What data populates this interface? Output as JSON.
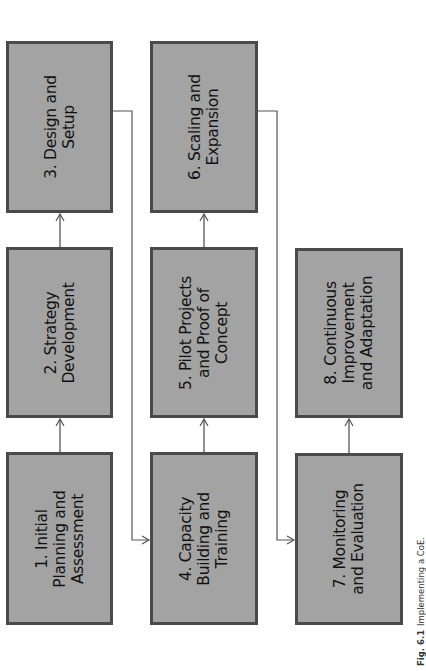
{
  "diagram": {
    "type": "process-flow",
    "orientation": "rotated -90deg",
    "colors": {
      "box_fill": "#a3a3a3",
      "box_border": "#4a4a4a",
      "connector": "#555555",
      "text": "#111111"
    },
    "steps": [
      {
        "id": 1,
        "label": "1. Initial\nPlanning and\nAssessment"
      },
      {
        "id": 2,
        "label": "2. Strategy\nDevelopment"
      },
      {
        "id": 3,
        "label": "3. Design and\nSetup"
      },
      {
        "id": 4,
        "label": "4. Capacity\nBuilding and\nTraining"
      },
      {
        "id": 5,
        "label": "5. Pilot Projects\nand Proof of\nConcept"
      },
      {
        "id": 6,
        "label": "6. Scaling and\nExpansion"
      },
      {
        "id": 7,
        "label": "7. Monitoring\nand Evaluation"
      },
      {
        "id": 8,
        "label": "8. Continuous\nImprovement\nand Adaptation"
      }
    ],
    "edges": [
      {
        "from": 1,
        "to": 2
      },
      {
        "from": 2,
        "to": 3
      },
      {
        "from": 3,
        "to": 4
      },
      {
        "from": 4,
        "to": 5
      },
      {
        "from": 5,
        "to": 6
      },
      {
        "from": 6,
        "to": 7
      },
      {
        "from": 7,
        "to": 8
      }
    ]
  },
  "caption": {
    "fig": "Fig. 6.1",
    "text": "Implementing a CoE."
  }
}
